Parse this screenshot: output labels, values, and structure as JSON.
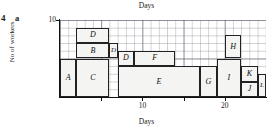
{
  "question": {
    "number": "4",
    "part": "a"
  },
  "labels": {
    "top_title": "Days",
    "bottom_title": "Days",
    "y_axis_title": "No of workers"
  },
  "axes": {
    "x_ticks": [
      {
        "value": 5,
        "label": ""
      },
      {
        "value": 10,
        "label": "10"
      },
      {
        "value": 15,
        "label": ""
      },
      {
        "value": 20,
        "label": "20"
      }
    ],
    "y_ticks": [
      {
        "value": 10,
        "label": "10"
      }
    ]
  },
  "chart_data": {
    "type": "bar",
    "title": "Days",
    "xlabel": "Days",
    "ylabel": "No of workers",
    "xlim": [
      0,
      25
    ],
    "ylim": [
      0,
      10
    ],
    "grid": true,
    "legend": "none",
    "blocks": [
      {
        "label": "A",
        "x_start": 0,
        "x_end": 2,
        "y_bottom": 0,
        "y_top": 5
      },
      {
        "label": "B",
        "x_start": 2,
        "x_end": 6,
        "y_bottom": 5,
        "y_top": 7
      },
      {
        "label": "C",
        "x_start": 2,
        "x_end": 6,
        "y_bottom": 0,
        "y_top": 5
      },
      {
        "label": "D",
        "x_start": 2,
        "x_end": 6,
        "y_bottom": 7,
        "y_top": 9
      },
      {
        "label": "D",
        "x_start": 6,
        "x_end": 7,
        "y_bottom": 5,
        "y_top": 7
      },
      {
        "label": "D",
        "x_start": 7,
        "x_end": 9,
        "y_bottom": 4,
        "y_top": 6
      },
      {
        "label": "F",
        "x_start": 9,
        "x_end": 14,
        "y_bottom": 4,
        "y_top": 6
      },
      {
        "label": "E",
        "x_start": 7,
        "x_end": 17,
        "y_bottom": 0,
        "y_top": 4
      },
      {
        "label": "G",
        "x_start": 17,
        "x_end": 19,
        "y_bottom": 0,
        "y_top": 4
      },
      {
        "label": "H",
        "x_start": 20,
        "x_end": 22,
        "y_bottom": 5,
        "y_top": 8
      },
      {
        "label": "I",
        "x_start": 19,
        "x_end": 22,
        "y_bottom": 0,
        "y_top": 5
      },
      {
        "label": "K",
        "x_start": 22,
        "x_end": 24,
        "y_bottom": 2,
        "y_top": 4
      },
      {
        "label": "J",
        "x_start": 22,
        "x_end": 24,
        "y_bottom": 0,
        "y_top": 2
      },
      {
        "label": "L",
        "x_start": 24,
        "x_end": 25,
        "y_bottom": 0,
        "y_top": 3
      }
    ]
  }
}
